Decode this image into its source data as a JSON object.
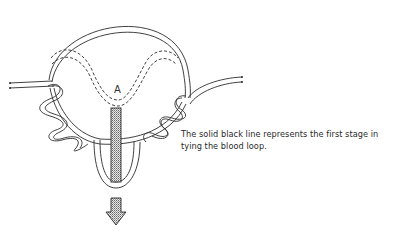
{
  "figure": {
    "point_label": "A",
    "caption_line1": "The solid black line represents the first stage in",
    "caption_line2": "tying the blood loop."
  },
  "colors": {
    "line": "#2b2b2b",
    "background": "#ffffff",
    "stipple": "#9a9a9a"
  }
}
